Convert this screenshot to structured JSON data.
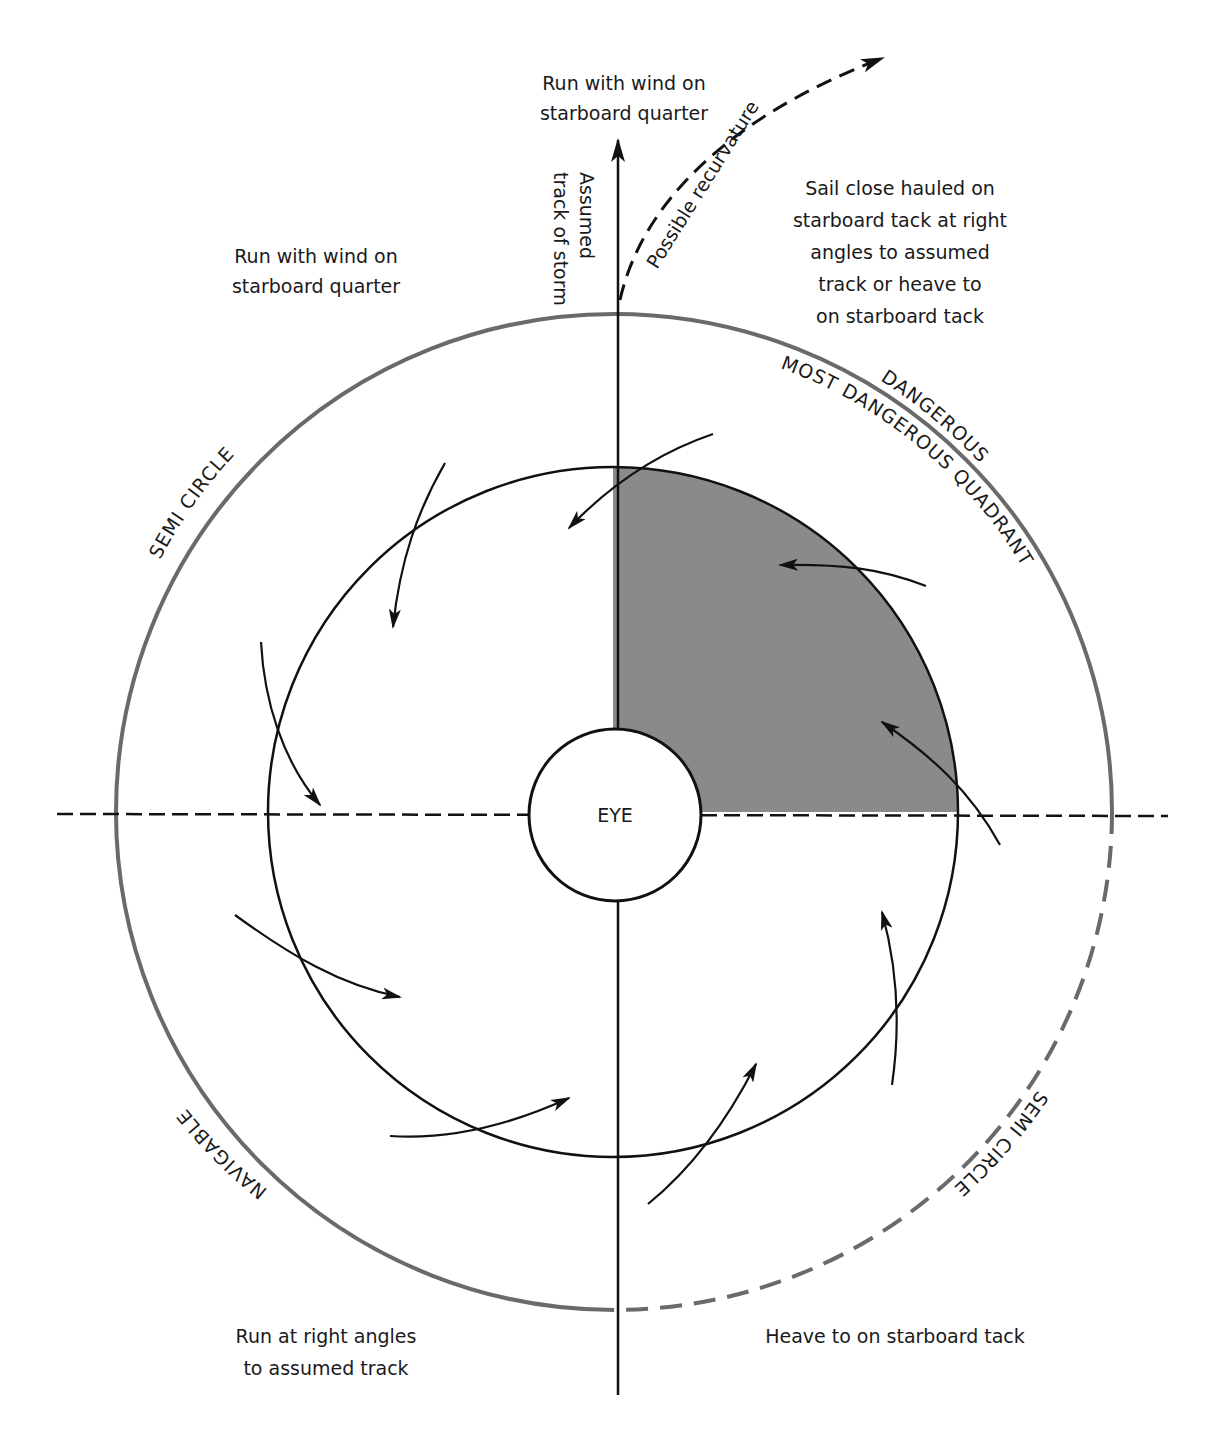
{
  "diagram": {
    "colors": {
      "outer_circle": "#6a6a6a",
      "inner_circle": "#111111",
      "shaded_quadrant": "#8a8a8a",
      "text": "#1a1a1a"
    },
    "center": {
      "label": "EYE"
    },
    "track": {
      "label_line1": "Assumed",
      "label_line2": "track of storm",
      "recurvature_label": "Possible recurvature"
    },
    "semicircle_labels": {
      "left_upper": "SEMI CIRCLE",
      "right_upper": "DANGEROUS",
      "most_dangerous": "MOST DANGEROUS QUADRANT",
      "left_lower": "NAVIGABLE",
      "right_lower": "SEMI CIRCLE"
    },
    "instructions": {
      "top_center": [
        "Run with wind on",
        "starboard quarter"
      ],
      "top_left": [
        "Run with wind on",
        "starboard quarter"
      ],
      "top_right": [
        "Sail close hauled on",
        "starboard tack at right",
        "angles to assumed",
        "track or heave to",
        "on starboard tack"
      ],
      "bottom_left": [
        "Run at right angles",
        "to assumed track"
      ],
      "bottom_right": [
        "Heave to on starboard tack"
      ]
    }
  }
}
